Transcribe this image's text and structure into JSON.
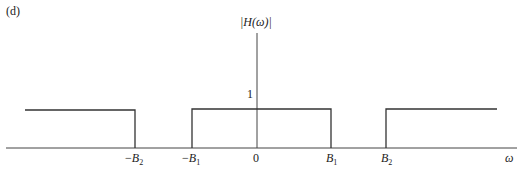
{
  "figure": {
    "panel_label": "(d)",
    "y_axis_label": "|H(ω)|",
    "x_axis_label": "ω",
    "level_label": "1",
    "ticks": [
      {
        "prefix": "−",
        "var": "B",
        "sub": "2"
      },
      {
        "prefix": "−",
        "var": "B",
        "sub": "1"
      },
      {
        "prefix": "",
        "var": "0",
        "sub": ""
      },
      {
        "prefix": "",
        "var": "B",
        "sub": "1"
      },
      {
        "prefix": "",
        "var": "B",
        "sub": "2"
      }
    ],
    "line_color": "#333333"
  }
}
